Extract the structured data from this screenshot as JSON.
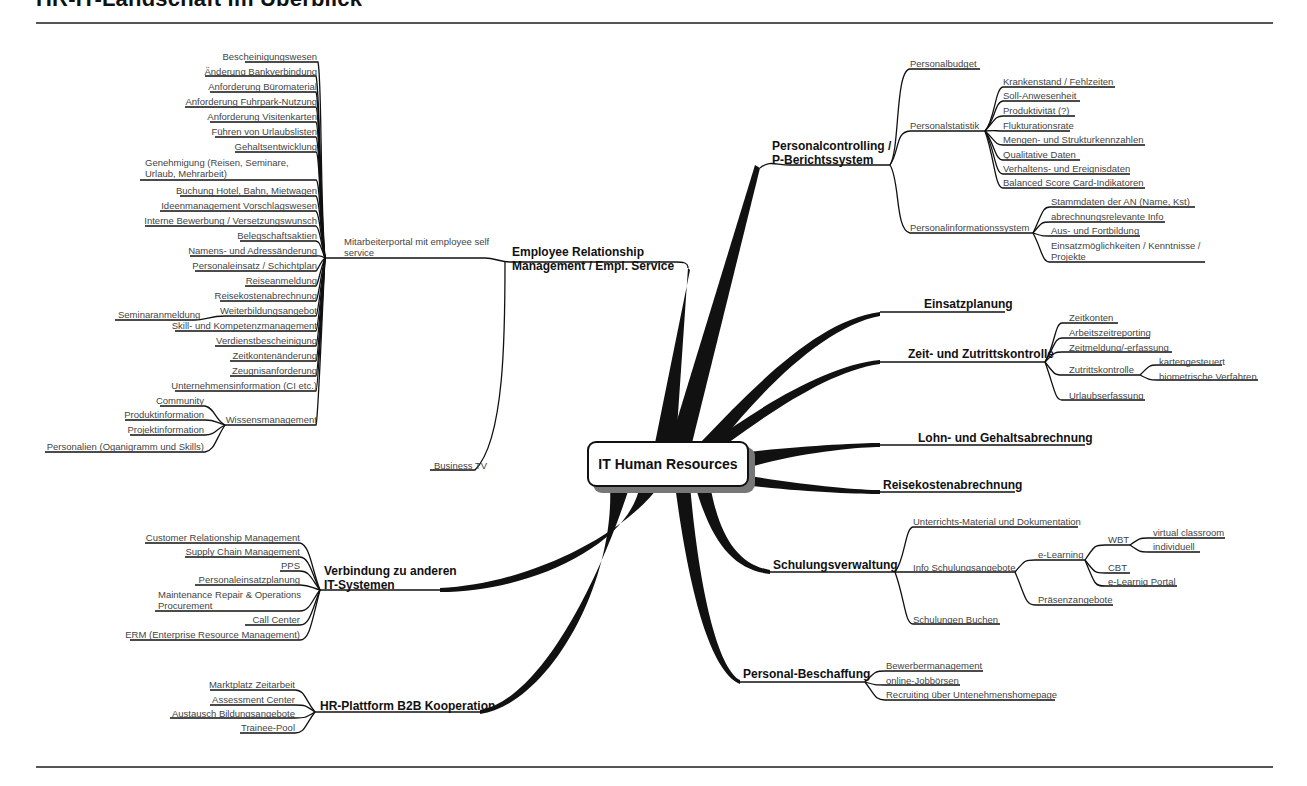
{
  "page": {
    "title": "HR-IT-Landschaft im Überblick"
  },
  "center": {
    "label": "IT Human Resources"
  },
  "branches": {
    "erm": {
      "label": "Employee Relationship Management / Empl. Service",
      "line1": "Employee Relationship",
      "line2": "Management / Empl. Service",
      "portal": {
        "label": "Mitarbeiterportal mit employee self service",
        "items": [
          "Bescheinigungswesen",
          "Änderung Bankverbindung",
          "Anforderung Büromaterial",
          "Anforderung Fuhrpark-Nutzung",
          "Anforderung Visitenkarten",
          "Führen von Urlaubslisten",
          "Gehaltsentwicklung",
          "Genehmigung (Reisen, Seminare, Urlaub, Mehrarbeit)",
          "Buchung Hotel, Bahn, Mietwagen",
          "Ideenmanagement Vorschlagswesen",
          "Interne Bewerbung / Versetzungswunsch",
          "Belegschaftsaktien",
          "Namens- und Adressänderung",
          "Personaleinsatz / Schichtplan",
          "Reiseanmeldung",
          "Reisekostenabrechnung",
          "Weiterbildungsangebot",
          "Skill- und Kompetenzmanagement",
          "Verdienstbescheinigung",
          "Zeitkontenänderung",
          "Zeugnisanforderung",
          "Unternehmensinformation (CI etc.)",
          "Wissensmanagement"
        ],
        "weiterbildung_child": "Seminaranmeldung",
        "wissen_children": [
          "Community",
          "Produktinformation",
          "Projektinformation",
          "Personalien (Oganigramm und Skills)"
        ]
      },
      "business_tv": "Business TV"
    },
    "controlling": {
      "line1": "Personalcontrolling /",
      "line2": "P-Berichtssystem",
      "budget": "Personalbudget",
      "statistik": {
        "label": "Personalstatistik",
        "items": [
          "Krankenstand / Fehlzeiten",
          "Soll-Anwesenheit",
          "Produktivität (?)",
          "Flukturationsrate",
          "Mengen- und Strukturkennzahlen",
          "Qualitative Daten",
          "Verhaltens- und Ereignisdaten",
          "Balanced Score Card-Indikatoren"
        ]
      },
      "pis": {
        "label": "Personalinformationssystem",
        "items": [
          "Stammdaten der AN (Name, Kst)",
          "abrechnungsrelevante Info",
          "Aus- und Fortbildung",
          "Einsatzmöglichkeiten / Kenntnisse / Projekte"
        ]
      }
    },
    "einsatz": {
      "label": "Einsatzplanung"
    },
    "zeit": {
      "label": "Zeit- und Zutrittskontrolle",
      "items": [
        "Zeitkonten",
        "Arbeitszeitreporting",
        "Zeitmeldung/-erfassung",
        "Zutrittskontrolle",
        "Urlaubserfassung"
      ],
      "zutritt_children": [
        "kartengesteuert",
        "biometrische Verfahren"
      ]
    },
    "lohn": {
      "label": "Lohn- und Gehaltsabrechnung"
    },
    "reise": {
      "label": "Reisekostenabrechnung"
    },
    "schulung": {
      "label": "Schulungsverwaltung",
      "items": [
        "Unterrichts-Material und Dokumentation",
        "Info Schulungsangebote",
        "Schulungen Buchen"
      ],
      "info_children": [
        "e-Learning",
        "Präsenzangebote"
      ],
      "elearning_children": [
        "WBT",
        "CBT",
        "e-Learnig Portal"
      ],
      "wbt_children": [
        "virtual classroom",
        "individuell"
      ]
    },
    "beschaffung": {
      "label": "Personal-Beschaffung",
      "items": [
        "Bewerbermanagement",
        "online-Jobbörsen",
        "Recruiting über Untenehmenshomepage"
      ]
    },
    "it": {
      "line1": "Verbindung zu anderen",
      "line2": "IT-Systemen",
      "items": [
        "Customer Relationship Management",
        "Supply Chain Management",
        "PPS",
        "Personaleinsatzplanung",
        "Maintenance Repair & Operations Procurement",
        "Call Center",
        "ERM (Enterprise Resource Management)"
      ]
    },
    "b2b": {
      "label": "HR-Plattform B2B Kooperation",
      "items": [
        "Marktplatz Zeitarbeit",
        "Assessment Center",
        "Austausch Bildungsangebote",
        "Trainee-Pool"
      ]
    }
  },
  "colors": {
    "line": "#111111",
    "text": "#444444",
    "rule": "#555555"
  }
}
